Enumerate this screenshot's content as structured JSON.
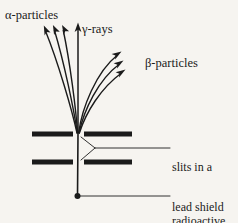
{
  "figure": {
    "background_color": "#f6f4f0",
    "ink_color": "#1b1b1b"
  },
  "labels": {
    "alpha": "α-particles",
    "gamma": "γ-rays",
    "beta": "β-particles",
    "slits_line1": "slits in a",
    "slits_line2": "lead shield",
    "source_line1": "radioactive",
    "source_line2": "source"
  },
  "diagram_data": {
    "type": "schematic",
    "source_point": {
      "x": 77,
      "y": 196
    },
    "slit_point": {
      "x": 78,
      "y": 134
    },
    "shield": {
      "bar_color": "#1b1b1b",
      "bar_thickness": 5,
      "upper_bar": {
        "y": 134,
        "left_x1": 32,
        "left_x2": 73,
        "right_x1": 84,
        "right_x2": 132
      },
      "lower_bar": {
        "y": 162,
        "left_x1": 32,
        "left_x2": 73,
        "right_x1": 84,
        "right_x2": 132
      }
    },
    "beams": {
      "alpha": {
        "count": 3,
        "label": "α-particles",
        "deflection": "left",
        "arrow_tips": [
          [
            44,
            27
          ],
          [
            53,
            26
          ],
          [
            62,
            26
          ]
        ]
      },
      "gamma": {
        "count": 1,
        "label": "γ-rays",
        "deflection": "none",
        "arrow_tips": [
          [
            78,
            23
          ]
        ]
      },
      "beta": {
        "count": 3,
        "label": "β-particles",
        "deflection": "right",
        "arrow_tips": [
          [
            120,
            52
          ],
          [
            122,
            61
          ],
          [
            124,
            70
          ]
        ]
      }
    },
    "leaders": {
      "slits": {
        "fork_x": 95,
        "fork_y": 148,
        "end_x": 170
      },
      "source": {
        "start_x": 80,
        "y": 196,
        "end_x": 170
      }
    }
  }
}
